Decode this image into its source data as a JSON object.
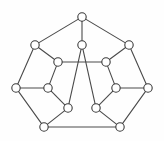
{
  "figure": {
    "kind": "node-link-diagram",
    "width": 164,
    "height": 141,
    "background_color": "#fefefe",
    "edge_color": "#4a4a4a",
    "node_fill_color": "#ffffff",
    "node_stroke_color": "#3a3a3a",
    "node_radius": 4.2,
    "edge_width": 1.1,
    "node_count": 15,
    "edge_count": 21
  },
  "chart_data": {
    "type": "graph",
    "directed": false,
    "weighted": false,
    "labels_shown": false,
    "xlim": [
      0,
      164
    ],
    "ylim": [
      0,
      141
    ],
    "nodes": [
      {
        "id": "n1",
        "name": "apex",
        "x": 82,
        "y": 17
      },
      {
        "id": "n2",
        "name": "upper-left-outer",
        "x": 35,
        "y": 45
      },
      {
        "id": "n3",
        "name": "upper-center",
        "x": 82,
        "y": 45
      },
      {
        "id": "n4",
        "name": "upper-right-outer",
        "x": 129,
        "y": 45
      },
      {
        "id": "n5",
        "name": "mid-left-inner",
        "x": 58,
        "y": 62
      },
      {
        "id": "n6",
        "name": "mid-right-inner",
        "x": 106,
        "y": 62
      },
      {
        "id": "n7",
        "name": "left-outer",
        "x": 16,
        "y": 88
      },
      {
        "id": "n8",
        "name": "left-inner",
        "x": 48,
        "y": 88
      },
      {
        "id": "n9",
        "name": "right-inner",
        "x": 116,
        "y": 88
      },
      {
        "id": "n10",
        "name": "right-outer",
        "x": 148,
        "y": 88
      },
      {
        "id": "n11",
        "name": "lower-left-inner",
        "x": 68,
        "y": 108
      },
      {
        "id": "n12",
        "name": "lower-right-inner",
        "x": 96,
        "y": 108
      },
      {
        "id": "n13",
        "name": "bottom-left",
        "x": 44,
        "y": 127
      },
      {
        "id": "n14",
        "name": "bottom-right",
        "x": 120,
        "y": 127
      },
      {
        "id": "n15",
        "name": "spare-unused",
        "x": 82,
        "y": 45
      }
    ],
    "edges": [
      {
        "source": "n1",
        "target": "n2"
      },
      {
        "source": "n1",
        "target": "n3"
      },
      {
        "source": "n1",
        "target": "n4"
      },
      {
        "source": "n2",
        "target": "n5"
      },
      {
        "source": "n2",
        "target": "n7"
      },
      {
        "source": "n3",
        "target": "n11"
      },
      {
        "source": "n3",
        "target": "n12"
      },
      {
        "source": "n4",
        "target": "n6"
      },
      {
        "source": "n4",
        "target": "n10"
      },
      {
        "source": "n5",
        "target": "n6"
      },
      {
        "source": "n5",
        "target": "n8"
      },
      {
        "source": "n6",
        "target": "n9"
      },
      {
        "source": "n7",
        "target": "n8"
      },
      {
        "source": "n7",
        "target": "n13"
      },
      {
        "source": "n8",
        "target": "n11"
      },
      {
        "source": "n9",
        "target": "n10"
      },
      {
        "source": "n9",
        "target": "n12"
      },
      {
        "source": "n10",
        "target": "n14"
      },
      {
        "source": "n11",
        "target": "n13"
      },
      {
        "source": "n12",
        "target": "n14"
      },
      {
        "source": "n13",
        "target": "n14"
      }
    ]
  }
}
